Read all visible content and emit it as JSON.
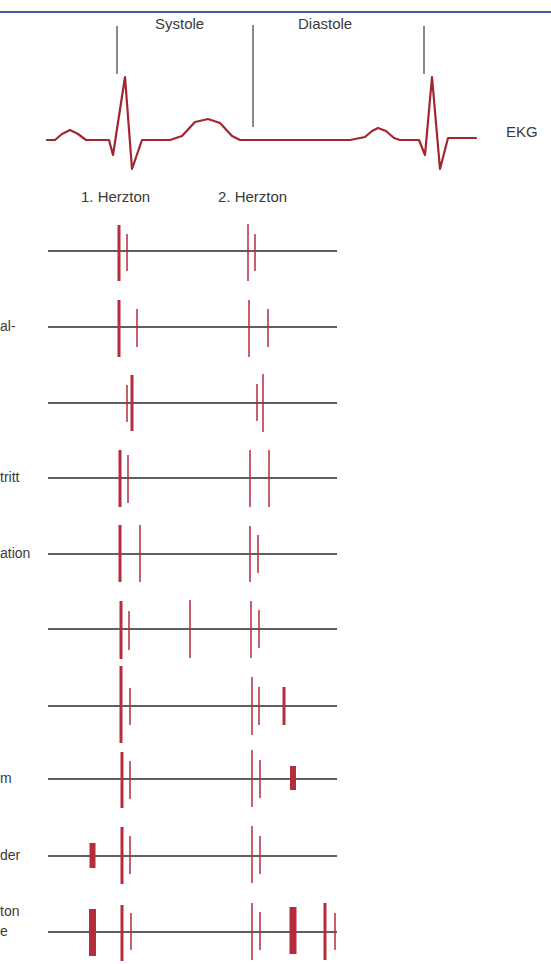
{
  "header": {
    "rule_color": "#4a5aa8",
    "phase_labels": {
      "systole": "Systole",
      "diastole": "Diastole"
    },
    "ekg_label": "EKG",
    "heart_sound_labels": {
      "first": "1. Herzton",
      "second": "2. Herzton"
    }
  },
  "colors": {
    "ekg_trace": "#a3262e",
    "sound_mark": "#b52c3c",
    "baseline": "#2a2a2a",
    "phase_divider": "#3a3a3a",
    "text": "#3a3a3a"
  },
  "ekg": {
    "points": [
      [
        47,
        140
      ],
      [
        55,
        140
      ],
      [
        62,
        134
      ],
      [
        70,
        130
      ],
      [
        78,
        134
      ],
      [
        86,
        140
      ],
      [
        109,
        140
      ],
      [
        113,
        155
      ],
      [
        125,
        77
      ],
      [
        132,
        169
      ],
      [
        142,
        140
      ],
      [
        170,
        140
      ],
      [
        182,
        136
      ],
      [
        195,
        122
      ],
      [
        208,
        119
      ],
      [
        220,
        123
      ],
      [
        232,
        136
      ],
      [
        240,
        140
      ],
      [
        350,
        140
      ],
      [
        365,
        137
      ],
      [
        372,
        131
      ],
      [
        378,
        128
      ],
      [
        386,
        131
      ],
      [
        394,
        138
      ],
      [
        400,
        140
      ],
      [
        419,
        140
      ],
      [
        425,
        155
      ],
      [
        432,
        77
      ],
      [
        440,
        169
      ],
      [
        448,
        138
      ],
      [
        476,
        138
      ]
    ],
    "dividers": [
      {
        "x": 117,
        "y1": 26,
        "y2": 74
      },
      {
        "x": 253,
        "y1": 25,
        "y2": 127
      },
      {
        "x": 424,
        "y1": 26,
        "y2": 74
      }
    ]
  },
  "rows": [
    {
      "label_fragment": "",
      "baseline_y": 251,
      "marks": [
        {
          "x": 119,
          "w": 3,
          "y1": 225,
          "y2": 281
        },
        {
          "x": 127,
          "w": 1.5,
          "y1": 234,
          "y2": 271
        },
        {
          "x": 248,
          "w": 1.5,
          "y1": 224,
          "y2": 281
        },
        {
          "x": 255,
          "w": 1.5,
          "y1": 234,
          "y2": 271
        }
      ]
    },
    {
      "label_fragment": "al-",
      "baseline_y": 327,
      "marks": [
        {
          "x": 119,
          "w": 3,
          "y1": 300,
          "y2": 357
        },
        {
          "x": 137,
          "w": 1.5,
          "y1": 309,
          "y2": 347
        },
        {
          "x": 249,
          "w": 1.5,
          "y1": 300,
          "y2": 357
        },
        {
          "x": 268,
          "w": 1.5,
          "y1": 309,
          "y2": 347
        }
      ]
    },
    {
      "label_fragment": "",
      "baseline_y": 403,
      "marks": [
        {
          "x": 127,
          "w": 1.5,
          "y1": 385,
          "y2": 422
        },
        {
          "x": 132,
          "w": 3,
          "y1": 375,
          "y2": 431
        },
        {
          "x": 257,
          "w": 1.5,
          "y1": 384,
          "y2": 421
        },
        {
          "x": 263,
          "w": 1.5,
          "y1": 374,
          "y2": 432
        }
      ]
    },
    {
      "label_fragment": "tritt",
      "baseline_y": 478,
      "marks": [
        {
          "x": 120,
          "w": 3,
          "y1": 450,
          "y2": 507
        },
        {
          "x": 128,
          "w": 1.5,
          "y1": 455,
          "y2": 503
        },
        {
          "x": 250,
          "w": 1.5,
          "y1": 450,
          "y2": 507
        },
        {
          "x": 269,
          "w": 1.5,
          "y1": 450,
          "y2": 507
        }
      ]
    },
    {
      "label_fragment": "ation",
      "baseline_y": 554,
      "marks": [
        {
          "x": 120,
          "w": 3,
          "y1": 525,
          "y2": 582
        },
        {
          "x": 140,
          "w": 1.5,
          "y1": 525,
          "y2": 582
        },
        {
          "x": 250,
          "w": 1.5,
          "y1": 526,
          "y2": 582
        },
        {
          "x": 258,
          "w": 1.5,
          "y1": 535,
          "y2": 573
        }
      ]
    },
    {
      "label_fragment": "",
      "baseline_y": 629,
      "marks": [
        {
          "x": 121,
          "w": 3,
          "y1": 601,
          "y2": 659
        },
        {
          "x": 129,
          "w": 1.5,
          "y1": 611,
          "y2": 650
        },
        {
          "x": 190,
          "w": 1.5,
          "y1": 600,
          "y2": 658
        },
        {
          "x": 251,
          "w": 1.5,
          "y1": 601,
          "y2": 658
        },
        {
          "x": 259,
          "w": 1.5,
          "y1": 610,
          "y2": 648
        }
      ]
    },
    {
      "label_fragment": "",
      "baseline_y": 706,
      "marks": [
        {
          "x": 121,
          "w": 3,
          "y1": 666,
          "y2": 743
        },
        {
          "x": 130,
          "w": 1.5,
          "y1": 688,
          "y2": 725
        },
        {
          "x": 252,
          "w": 1.5,
          "y1": 677,
          "y2": 735
        },
        {
          "x": 259,
          "w": 1.5,
          "y1": 687,
          "y2": 725
        },
        {
          "x": 284,
          "w": 3,
          "y1": 687,
          "y2": 725
        }
      ]
    },
    {
      "label_fragment": "m",
      "baseline_y": 779,
      "marks": [
        {
          "x": 122,
          "w": 3,
          "y1": 752,
          "y2": 808
        },
        {
          "x": 130,
          "w": 1.5,
          "y1": 761,
          "y2": 799
        },
        {
          "x": 252,
          "w": 1.5,
          "y1": 750,
          "y2": 807
        },
        {
          "x": 260,
          "w": 1.5,
          "y1": 760,
          "y2": 798
        },
        {
          "x": 293,
          "w": 6,
          "y1": 766,
          "y2": 790
        }
      ]
    },
    {
      "label_fragment": "der",
      "baseline_y": 856,
      "marks": [
        {
          "x": 92.5,
          "w": 6,
          "y1": 843,
          "y2": 868
        },
        {
          "x": 122,
          "w": 3,
          "y1": 827,
          "y2": 884
        },
        {
          "x": 130,
          "w": 1.5,
          "y1": 836,
          "y2": 874
        },
        {
          "x": 252,
          "w": 1.5,
          "y1": 826,
          "y2": 883
        },
        {
          "x": 260,
          "w": 1.5,
          "y1": 836,
          "y2": 874
        }
      ]
    },
    {
      "label_fragment": "ton\ne",
      "baseline_y": 932,
      "marks": [
        {
          "x": 92.5,
          "w": 7,
          "y1": 909,
          "y2": 956
        },
        {
          "x": 122,
          "w": 3,
          "y1": 905,
          "y2": 961
        },
        {
          "x": 131,
          "w": 1.5,
          "y1": 913,
          "y2": 950
        },
        {
          "x": 252,
          "w": 1.5,
          "y1": 903,
          "y2": 960
        },
        {
          "x": 260,
          "w": 1.5,
          "y1": 912,
          "y2": 950
        },
        {
          "x": 293,
          "w": 7,
          "y1": 907,
          "y2": 954
        },
        {
          "x": 325,
          "w": 3,
          "y1": 903,
          "y2": 960
        },
        {
          "x": 335,
          "w": 1.5,
          "y1": 913,
          "y2": 950
        }
      ]
    }
  ],
  "row_label_lines": [
    {
      "text": "al-",
      "y": 318
    },
    {
      "text": "tritt",
      "y": 469
    },
    {
      "text": "ation",
      "y": 545
    },
    {
      "text": "m",
      "y": 770
    },
    {
      "text": "der",
      "y": 847
    },
    {
      "text": "ton",
      "y": 903
    },
    {
      "text": "e",
      "y": 923
    }
  ],
  "baseline_extent": {
    "x1": 48,
    "x2": 337
  }
}
